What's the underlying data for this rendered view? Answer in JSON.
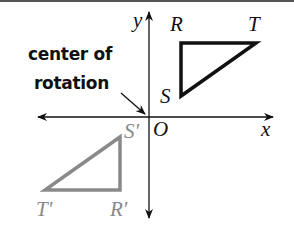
{
  "diagram": {
    "callout": {
      "line1": "center of",
      "line2": "rotation"
    },
    "axes": {
      "x_label": "x",
      "y_label": "y",
      "origin_label": "O"
    },
    "original_triangle": {
      "color": "#111111",
      "vertices": {
        "R": "R",
        "S": "S",
        "T": "T"
      }
    },
    "image_triangle": {
      "color": "#888888",
      "vertices": {
        "R": "R′",
        "S": "S′",
        "T": "T′"
      }
    }
  }
}
